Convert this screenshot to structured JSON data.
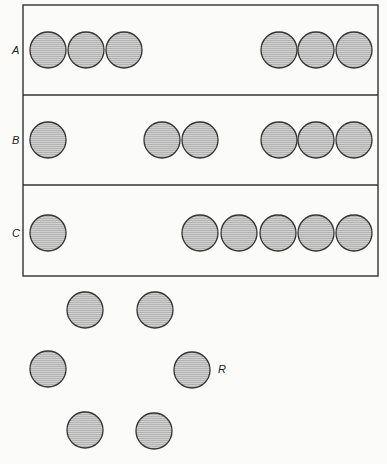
{
  "diagram": {
    "frame": {
      "x": 23,
      "y": 5,
      "width": 355,
      "height": 271
    },
    "dividers_y": [
      95,
      185
    ],
    "circle_radius": 18,
    "circle_fill": "#c9c9c9",
    "circle_stroke": "#333333",
    "rows": [
      {
        "label": "A",
        "label_x": 12,
        "y": 50,
        "circle_x": [
          48,
          86,
          124,
          279,
          316,
          354
        ]
      },
      {
        "label": "B",
        "label_x": 12,
        "y": 140,
        "circle_x": [
          48,
          162,
          200,
          279,
          316,
          354
        ]
      },
      {
        "label": "C",
        "label_x": 12,
        "y": 233,
        "circle_x": [
          48,
          200,
          239,
          278,
          316,
          354
        ]
      }
    ],
    "ring": {
      "label": "R",
      "label_pos": [
        218,
        373
      ],
      "circles": [
        [
          85,
          310
        ],
        [
          155,
          310
        ],
        [
          48,
          369
        ],
        [
          192,
          370
        ],
        [
          85,
          430
        ],
        [
          154,
          431
        ]
      ]
    }
  }
}
